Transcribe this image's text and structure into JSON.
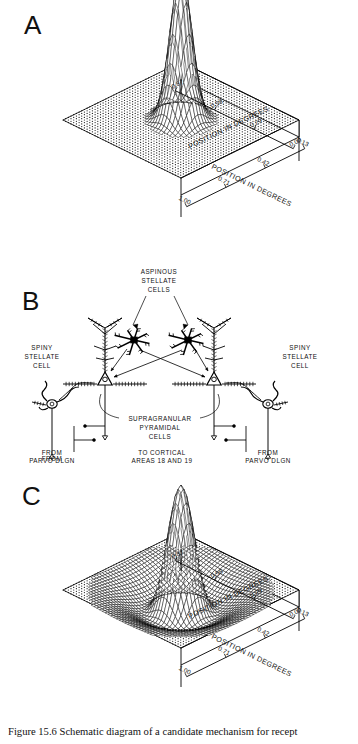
{
  "figure": {
    "caption": "Figure 15.6 Schematic diagram of a candidate mechanism for recept",
    "panels": [
      {
        "id": "A",
        "label": "A"
      },
      {
        "id": "B",
        "label": "B"
      },
      {
        "id": "C",
        "label": "C"
      }
    ]
  },
  "panel_a": {
    "letter": "A",
    "axis_left": {
      "title": "POSITION IN DEGREES",
      "ticks": [
        "1.00",
        "0.71",
        "0.42",
        "0.13"
      ]
    },
    "axis_right": {
      "title": "POSITION IN DEGREES",
      "ticks": [
        "0.00",
        "0.29",
        "0.58",
        "0.87"
      ]
    }
  },
  "panel_c": {
    "letter": "C",
    "axis_left": {
      "title": "POSITION IN DEGREES",
      "ticks": [
        "1.00",
        "0.71",
        "0.42",
        "0.13"
      ]
    },
    "axis_right": {
      "title": "POSITION IN DEGREES",
      "ticks": [
        "0.00",
        "0.29",
        "0.58",
        "0.87"
      ]
    }
  },
  "panel_b": {
    "letter": "B",
    "labels": {
      "aspinous": "ASPINOUS\nSTELLATE\nCELLS",
      "aspinous_l1": "ASPINOUS",
      "aspinous_l2": "STELLATE",
      "aspinous_l3": "CELLS",
      "spiny_left_l1": "SPINY",
      "spiny_left_l2": "STELLATE",
      "spiny_left_l3": "CELL",
      "spiny_right_l1": "SPINY",
      "spiny_right_l2": "STELLATE",
      "spiny_right_l3": "CELL",
      "supra_l1": "SUPRAGRANULAR",
      "supra_l2": "PYRAMIDAL",
      "supra_l3": "CELLS",
      "from_left_l1": "FROM",
      "from_left_l2": "PARVO DLGN",
      "from_right_l1": "FROM",
      "from_right_l2": "PARVO DLGN",
      "to_cortical_l1": "TO CORTICAL",
      "to_cortical_l2": "AREAS 18 AND 19"
    }
  },
  "chart_data": [
    {
      "type": "surface",
      "panel": "A",
      "title": "",
      "xlabel": "POSITION IN DEGREES",
      "ylabel": "POSITION IN DEGREES",
      "zlabel": "",
      "xlim": [
        0.0,
        0.87
      ],
      "ylim": [
        0.13,
        1.0
      ],
      "xticks": [
        "0.00",
        "0.29",
        "0.58",
        "0.87"
      ],
      "yticks": [
        "1.00",
        "0.71",
        "0.42",
        "0.13"
      ],
      "grid": true,
      "legend": "none",
      "description": "Narrow single Gaussian excitatory peak centered on a flat mesh plane",
      "function": "gaussian",
      "center": [
        0.5,
        0.5
      ],
      "amplitude": 1.0,
      "sigma": 0.065,
      "surround_amplitude": 0.0,
      "surround_sigma": 0.0,
      "grid_n": 42
    },
    {
      "type": "surface",
      "panel": "C",
      "title": "",
      "xlabel": "POSITION IN DEGREES",
      "ylabel": "POSITION IN DEGREES",
      "zlabel": "",
      "xlim": [
        0.0,
        0.87
      ],
      "ylim": [
        0.13,
        1.0
      ],
      "xticks": [
        "0.00",
        "0.29",
        "0.58",
        "0.87"
      ],
      "yticks": [
        "1.00",
        "0.71",
        "0.42",
        "0.13"
      ],
      "grid": true,
      "legend": "none",
      "description": "Difference-of-Gaussians (Mexican hat): tall narrow central peak surrounded by an annular inhibitory trough",
      "function": "difference-of-gaussians",
      "center": [
        0.5,
        0.5
      ],
      "amplitude": 1.0,
      "sigma": 0.085,
      "surround_amplitude": 0.3,
      "surround_sigma": 0.21,
      "grid_n": 42
    }
  ]
}
